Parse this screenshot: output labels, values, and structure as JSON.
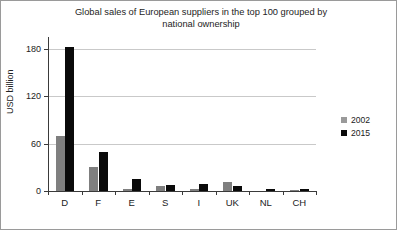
{
  "chart_data": {
    "type": "bar",
    "title": "Global sales of European suppliers in the top 100 grouped by\nnational ownership",
    "xlabel": "",
    "ylabel": "USD billion",
    "categories": [
      "D",
      "F",
      "E",
      "S",
      "I",
      "UK",
      "NL",
      "CH"
    ],
    "series": [
      {
        "name": "2002",
        "color": "#7f7f7f",
        "values": [
          70,
          30,
          2,
          6,
          3,
          11,
          0,
          1
        ]
      },
      {
        "name": "2015",
        "color": "#0a0a0a",
        "values": [
          182,
          50,
          15,
          8,
          9,
          6,
          2,
          2
        ]
      }
    ],
    "ylim": [
      0,
      195
    ],
    "yticks": [
      0,
      60,
      120,
      180
    ],
    "ytick_labels": [
      "0",
      "60",
      "120",
      "180"
    ],
    "grid": true,
    "legend_position": "right"
  },
  "legend": {
    "entries": [
      {
        "label": "2002"
      },
      {
        "label": "2015"
      }
    ]
  }
}
